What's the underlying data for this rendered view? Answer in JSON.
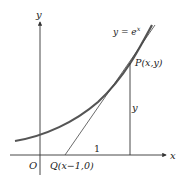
{
  "diagram": {
    "axes": {
      "x_label": "x",
      "y_label": "y",
      "origin_label": "O"
    },
    "curve": {
      "label": "y = e",
      "exponent": "x"
    },
    "points": {
      "P": {
        "label": "P(x,y)"
      },
      "Q": {
        "label": "Q(x−1,0)"
      }
    },
    "segments": {
      "vertical_label": "y",
      "base_label": "1"
    },
    "colors": {
      "curve": "#555555",
      "axes": "#333333",
      "tangent": "#444444"
    }
  }
}
